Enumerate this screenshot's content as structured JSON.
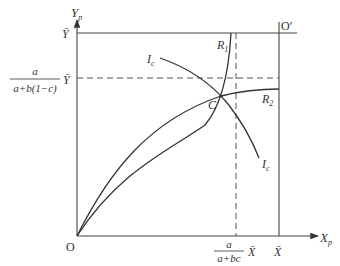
{
  "diagram": {
    "axes": {
      "y_label_main": "Y",
      "y_label_sub": "p",
      "x_label_main": "X",
      "x_label_sub": "p",
      "origin": "O",
      "origin_prime": "O′"
    },
    "y_ticks": {
      "top": "Ȳ",
      "mid_frac_num": "a",
      "mid_frac_den": "a+b(1−c)",
      "mid": "Ȳ"
    },
    "x_ticks": {
      "mid_frac_num": "a",
      "mid_frac_den": "a+bc",
      "mid": "X̄",
      "right": "X̄"
    },
    "curves": {
      "r1_main": "R",
      "r1_sub": "1",
      "r2_main": "R",
      "r2_sub": "2",
      "ic_main": "I",
      "ic_sub": "c",
      "intersection": "C"
    }
  }
}
